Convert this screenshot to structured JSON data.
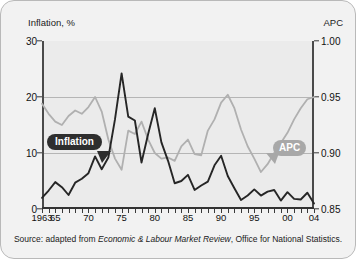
{
  "figure": {
    "caption_prefix": "Source: adapted from ",
    "caption_italic": "Economic & Labour Market Review",
    "caption_suffix": ", Office for National Statistics."
  },
  "axes": {
    "left_title": "Inflation, %",
    "right_title": "APC",
    "left_ticks": [
      "30",
      "20",
      "10",
      "0"
    ],
    "right_ticks": [
      "1.00",
      "0.95",
      "0.90",
      "0.85"
    ],
    "x_ticks": [
      "1963",
      "65",
      "70",
      "75",
      "80",
      "85",
      "90",
      "95",
      "00",
      "04"
    ]
  },
  "labels": {
    "inflation": "Inflation",
    "apc": "APC"
  },
  "colors": {
    "inflation_line": "#262626",
    "apc_line": "#b0b0b0",
    "plot_background": "#ebebeb",
    "figure_background": "#f2f2f2",
    "gridline": "#b5b5b5",
    "frame_border": "#b9b9b9"
  },
  "chart_data": {
    "type": "line",
    "title": "",
    "xlabel": "",
    "ylabel": "Inflation, %",
    "y2label": "APC",
    "xlim": [
      1963,
      2004
    ],
    "ylim": [
      0,
      30
    ],
    "y2lim": [
      0.85,
      1.0
    ],
    "grid": true,
    "legend_position": "inline-callout",
    "x": [
      1963,
      1964,
      1965,
      1966,
      1967,
      1968,
      1969,
      1970,
      1971,
      1972,
      1973,
      1974,
      1975,
      1976,
      1977,
      1978,
      1979,
      1980,
      1981,
      1982,
      1983,
      1984,
      1985,
      1986,
      1987,
      1988,
      1989,
      1990,
      1991,
      1992,
      1993,
      1994,
      1995,
      1996,
      1997,
      1998,
      1999,
      2000,
      2001,
      2002,
      2003,
      2004
    ],
    "series": [
      {
        "name": "Inflation",
        "axis": "left",
        "color": "#262626",
        "units": "%",
        "values": [
          2.0,
          3.3,
          4.8,
          3.9,
          2.5,
          4.7,
          5.4,
          6.4,
          9.4,
          7.1,
          9.2,
          16.0,
          24.2,
          16.5,
          15.8,
          8.3,
          13.4,
          18.0,
          11.9,
          8.6,
          4.6,
          5.0,
          6.1,
          3.4,
          4.2,
          4.9,
          7.8,
          9.5,
          5.9,
          3.7,
          1.6,
          2.4,
          3.5,
          2.4,
          3.1,
          3.4,
          1.5,
          3.0,
          1.8,
          1.7,
          2.9,
          1.0
        ]
      },
      {
        "name": "APC",
        "axis": "right",
        "color": "#b0b0b0",
        "units": "",
        "values": [
          0.944,
          0.935,
          0.928,
          0.925,
          0.933,
          0.938,
          0.935,
          0.941,
          0.95,
          0.937,
          0.912,
          0.895,
          0.885,
          0.92,
          0.917,
          0.928,
          0.912,
          0.9,
          0.895,
          0.896,
          0.893,
          0.906,
          0.912,
          0.899,
          0.898,
          0.92,
          0.93,
          0.945,
          0.952,
          0.94,
          0.921,
          0.906,
          0.895,
          0.883,
          0.89,
          0.9,
          0.909,
          0.918,
          0.93,
          0.94,
          0.948,
          0.95
        ]
      }
    ]
  }
}
